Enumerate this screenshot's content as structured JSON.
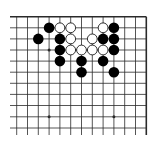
{
  "board": {
    "description": "Go board fragment (top-right corner view)",
    "colors": {
      "background": "#ffffff",
      "line": "#2a2a2a",
      "black_stone": "#000000",
      "white_stone": "#ffffff",
      "white_stone_border": "#000000"
    },
    "grid": {
      "cols_x": [
        16.7,
        27.5,
        38.3,
        49.1,
        59.9,
        70.7,
        81.5,
        92.3,
        103.1,
        113.9,
        124.7,
        135.5,
        146.3
      ],
      "rows_y": [
        16.7,
        27.8,
        38.9,
        50.0,
        61.1,
        72.2,
        83.3,
        94.4,
        105.5,
        116.8,
        128.0
      ],
      "line_extend_left": 10,
      "line_extend_bottom": 135,
      "top_edge": true,
      "right_edge": true,
      "left_edge": false,
      "bottom_edge": false
    },
    "star_points": [
      {
        "col": 3,
        "row": 3
      },
      {
        "col": 3,
        "row": 9
      },
      {
        "col": 9,
        "row": 9
      }
    ],
    "stones": [
      {
        "color": "black",
        "col": 3,
        "row": 1
      },
      {
        "color": "white",
        "col": 4,
        "row": 1
      },
      {
        "color": "white",
        "col": 5,
        "row": 1
      },
      {
        "color": "white",
        "col": 8,
        "row": 1
      },
      {
        "color": "black",
        "col": 9,
        "row": 1
      },
      {
        "color": "black",
        "col": 2,
        "row": 2
      },
      {
        "color": "black",
        "col": 4,
        "row": 2
      },
      {
        "color": "white",
        "col": 5,
        "row": 2
      },
      {
        "color": "white",
        "col": 7,
        "row": 2
      },
      {
        "color": "black",
        "col": 8,
        "row": 2
      },
      {
        "color": "black",
        "col": 9,
        "row": 2
      },
      {
        "color": "black",
        "col": 4,
        "row": 3
      },
      {
        "color": "white",
        "col": 5,
        "row": 3
      },
      {
        "color": "white",
        "col": 6,
        "row": 3
      },
      {
        "color": "white",
        "col": 7,
        "row": 3
      },
      {
        "color": "white",
        "col": 8,
        "row": 3
      },
      {
        "color": "black",
        "col": 9,
        "row": 3
      },
      {
        "color": "black",
        "col": 4,
        "row": 4
      },
      {
        "color": "black",
        "col": 6,
        "row": 4
      },
      {
        "color": "black",
        "col": 8,
        "row": 4
      },
      {
        "color": "black",
        "col": 6,
        "row": 5
      },
      {
        "color": "black",
        "col": 9,
        "row": 5
      }
    ]
  }
}
